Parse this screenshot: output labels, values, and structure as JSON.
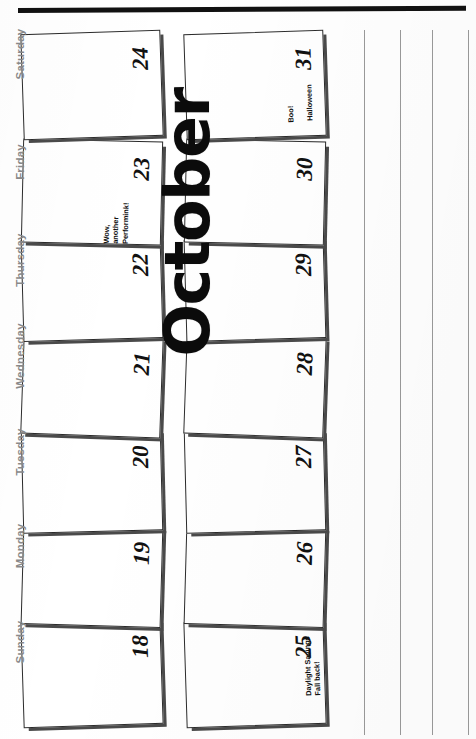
{
  "document": {
    "type": "scanned-calendar-page",
    "orientation": "rotated-90-ccw",
    "month_title": "October",
    "title_color": "#0b0b0b",
    "day_label_color": "#8a8a8a",
    "binding_bar_color": "#111111",
    "rule_line_color": "#9a9a9a",
    "cell_shadow_color": "#4a4a4a",
    "paper_color": "#ffffff"
  },
  "weekday_headers": [
    {
      "label": "Sunday"
    },
    {
      "label": "Monday"
    },
    {
      "label": "Tuesday"
    },
    {
      "label": "Wednesday"
    },
    {
      "label": "Thursday"
    },
    {
      "label": "Friday"
    },
    {
      "label": "Saturday"
    }
  ],
  "weeks": [
    {
      "name": "week-oct-18-24",
      "days": [
        {
          "number": "18",
          "weekday": "Sunday",
          "note": ""
        },
        {
          "number": "19",
          "weekday": "Monday",
          "note": ""
        },
        {
          "number": "20",
          "weekday": "Tuesday",
          "note": ""
        },
        {
          "number": "21",
          "weekday": "Wednesday",
          "note": ""
        },
        {
          "number": "22",
          "weekday": "Thursday",
          "note": ""
        },
        {
          "number": "23",
          "weekday": "Friday",
          "note": "Wow,\nanother\nPerformink!"
        },
        {
          "number": "24",
          "weekday": "Saturday",
          "note": ""
        }
      ]
    },
    {
      "name": "week-oct-25-31",
      "days": [
        {
          "number": "25",
          "weekday": "Sunday",
          "note": "Daylight Savings\nFall back!"
        },
        {
          "number": "26",
          "weekday": "Monday",
          "note": ""
        },
        {
          "number": "27",
          "weekday": "Tuesday",
          "note": ""
        },
        {
          "number": "28",
          "weekday": "Wednesday",
          "note": ""
        },
        {
          "number": "29",
          "weekday": "Thursday",
          "note": ""
        },
        {
          "number": "30",
          "weekday": "Friday",
          "note": ""
        },
        {
          "number": "31",
          "weekday": "Saturday",
          "note": "Boo!",
          "note2": "Halloween"
        }
      ]
    }
  ],
  "rule_lines": {
    "count": 4,
    "positions": [
      364,
      400,
      432,
      468
    ]
  },
  "geometry": {
    "day_label_tops": [
      636,
      540,
      446,
      350,
      254,
      156,
      48
    ],
    "row1_left": 22,
    "row1_width": 138,
    "row2_left": 185,
    "row2_width": 138,
    "cell_tops": [
      620,
      524,
      430,
      334,
      238,
      140,
      32
    ],
    "cell_heights": [
      104,
      100,
      100,
      100,
      100,
      102,
      104
    ],
    "rotations": [
      -1.8,
      1.6,
      -1.4,
      2.0,
      -1.6,
      1.3,
      -1.9
    ]
  }
}
